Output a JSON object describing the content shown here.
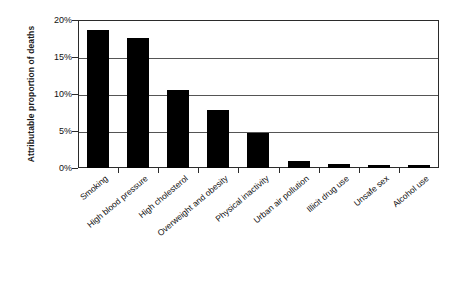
{
  "chart_data": {
    "type": "bar",
    "title": "",
    "xlabel": "",
    "ylabel": "Attributable proportion of deaths",
    "ylim": [
      0,
      20
    ],
    "ytick_labels": [
      "20%",
      "15%",
      "10%",
      "5%",
      "0%"
    ],
    "ytick_values": [
      20,
      15,
      10,
      5,
      0
    ],
    "grid": "horizontal",
    "legend": "none",
    "bar_color": "#000000",
    "categories": [
      "Smoking",
      "High blood pressure",
      "High cholesterol",
      "Overweight and obesity",
      "Physical inactivity",
      "Urban air pollution",
      "Illicit drug use",
      "Unsafe sex",
      "Alcohol use"
    ],
    "values": [
      18.6,
      17.6,
      10.6,
      7.8,
      4.7,
      1.0,
      0.5,
      0.4,
      0.35
    ],
    "value_unit": "percent"
  }
}
